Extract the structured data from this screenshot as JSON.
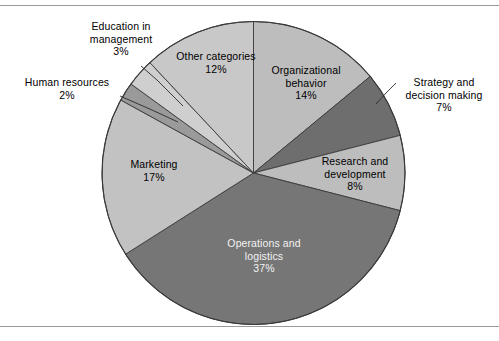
{
  "figure": {
    "type": "pie-chart-figure",
    "background": "#ffffff",
    "top_rule": true,
    "bottom_rule": true,
    "rule_color": "#9a9a9a"
  },
  "chart_data": {
    "type": "pie",
    "title": "",
    "xlabel": "",
    "ylabel": "",
    "legend_position": "none",
    "labels_on_slices": true,
    "start_angle_deg": 0,
    "direction": "clockwise",
    "categories": [
      "Organizational behavior",
      "Strategy and decision making",
      "Research and development",
      "Operations and logistics",
      "Marketing",
      "Human resources",
      "Education in management",
      "Other categories"
    ],
    "values": [
      14,
      7,
      8,
      37,
      17,
      2,
      3,
      12
    ],
    "value_labels": [
      "14%",
      "7%",
      "8%",
      "37%",
      "17%",
      "2%",
      "3%",
      "12%"
    ],
    "unit": "%",
    "total": 100,
    "colors": [
      "#bdbdbd",
      "#6e6e6e",
      "#bdbdbd",
      "#767676",
      "#c2c2c2",
      "#9a9a9a",
      "#cfcfcf",
      "#c8c8c8"
    ],
    "slice_border_color": "#3a3a3a",
    "slices": [
      {
        "label": "Organizational behavior",
        "value": 14,
        "pct_text": "14%",
        "color": "#bdbdbd",
        "label_placement": "inside",
        "text_color": "dark",
        "leader_line": false
      },
      {
        "label": "Strategy and decision making",
        "value": 7,
        "pct_text": "7%",
        "color": "#6e6e6e",
        "label_placement": "outside",
        "text_color": "dark",
        "leader_line": true
      },
      {
        "label": "Research and development",
        "value": 8,
        "pct_text": "8%",
        "color": "#bdbdbd",
        "label_placement": "inside",
        "text_color": "dark",
        "leader_line": false
      },
      {
        "label": "Operations and logistics",
        "value": 37,
        "pct_text": "37%",
        "color": "#767676",
        "label_placement": "inside",
        "text_color": "light",
        "leader_line": false
      },
      {
        "label": "Marketing",
        "value": 17,
        "pct_text": "17%",
        "color": "#c2c2c2",
        "label_placement": "inside",
        "text_color": "dark",
        "leader_line": false
      },
      {
        "label": "Human resources",
        "value": 2,
        "pct_text": "2%",
        "color": "#9a9a9a",
        "label_placement": "outside",
        "text_color": "dark",
        "leader_line": true
      },
      {
        "label": "Education in management",
        "value": 3,
        "pct_text": "3%",
        "color": "#cfcfcf",
        "label_placement": "outside",
        "text_color": "dark",
        "leader_line": true
      },
      {
        "label": "Other categories",
        "value": 12,
        "pct_text": "12%",
        "color": "#c8c8c8",
        "label_placement": "inside",
        "text_color": "dark",
        "leader_line": false
      }
    ]
  },
  "labels": {
    "organizational_behavior": {
      "name": "Organizational",
      "name2": "behavior",
      "pct": "14%"
    },
    "strategy": {
      "name": "Strategy and",
      "name2": "decision making",
      "pct": "7%"
    },
    "research": {
      "name": "Research and",
      "name2": "development",
      "pct": "8%"
    },
    "operations": {
      "name": "Operations and",
      "name2": "logistics",
      "pct": "37%"
    },
    "marketing": {
      "name": "Marketing",
      "pct": "17%"
    },
    "human_resources": {
      "name": "Human resources",
      "pct": "2%"
    },
    "education": {
      "name": "Education in",
      "name2": "management",
      "pct": "3%"
    },
    "other": {
      "name": "Other categories",
      "pct": "12%"
    }
  }
}
